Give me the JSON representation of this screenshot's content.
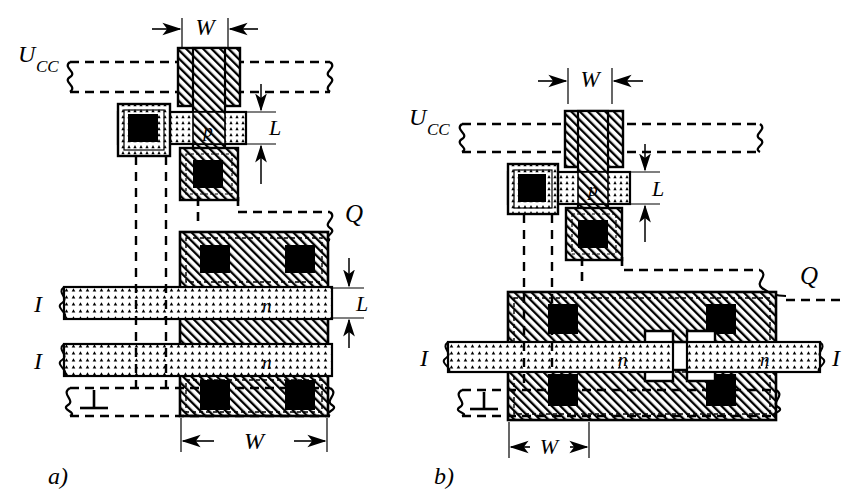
{
  "figure": {
    "panels": [
      {
        "id": "a",
        "caption": "a)",
        "labels": {
          "supply": "U",
          "supply_sub": "CC",
          "output": "Q",
          "ground": "⊥",
          "input_left_top": "I",
          "input_left_bottom": "I",
          "pmos_region": "p",
          "nmos_region_top": "n",
          "nmos_region_bottom": "n",
          "dim_width_top": "W",
          "dim_width_bottom": "W",
          "dim_length_top": "L",
          "dim_length_bottom": "L"
        }
      },
      {
        "id": "b",
        "caption": "b)",
        "labels": {
          "supply": "U",
          "supply_sub": "CC",
          "output": "Q",
          "ground": "⊥",
          "input_left": "I",
          "input_right": "I",
          "pmos_region": "p",
          "nmos_region_left": "n",
          "nmos_region_right": "n",
          "dim_width_top": "W",
          "dim_width_bottom": "W",
          "dim_length": "L"
        }
      }
    ],
    "colors": {
      "ink": "#000000",
      "paper": "#ffffff",
      "metal_hatch": "#000000",
      "diffusion_stipple": "#000000",
      "contact_fill": "#111111"
    },
    "legend_semantics": {
      "diagonal_hatch": "polysilicon / metal region",
      "stipple": "n-type diffusion",
      "solid_black_square": "contact window",
      "dashed_line": "metal interconnect"
    }
  }
}
